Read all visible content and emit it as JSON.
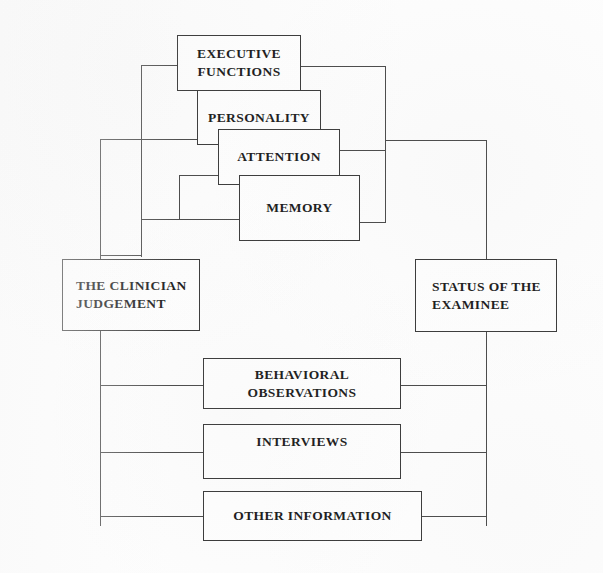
{
  "diagram": {
    "colors": {
      "background": "#fdfdfd",
      "box_fill": "#fefefe",
      "box_border": "#3a3a3a",
      "connector": "#4a4a4a",
      "text": "#1b1b1b"
    },
    "nodes": {
      "executive_functions": {
        "line1": "EXECUTIVE",
        "line2": "FUNCTIONS"
      },
      "personality": {
        "line1": "PERSONALITY",
        "line2": ""
      },
      "attention": {
        "line1": "ATTENTION",
        "line2": ""
      },
      "memory": {
        "line1": "MEMORY",
        "line2": ""
      },
      "clinician_judgement": {
        "line1": "THE CLINICIAN",
        "line2": "JUDGEMENT"
      },
      "status_examinee": {
        "line1": "STATUS OF THE",
        "line2": "EXAMINEE"
      },
      "behavioral_observations": {
        "line1": "BEHAVIORAL",
        "line2": "OBSERVATIONS"
      },
      "interviews": {
        "line1": "INTERVIEWS",
        "line2": ""
      },
      "other_information": {
        "line1": "OTHER INFORMATION",
        "line2": ""
      }
    }
  }
}
